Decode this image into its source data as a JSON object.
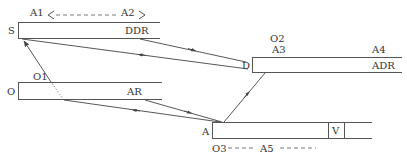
{
  "colors": {
    "line": "#444444",
    "text": "#333333",
    "background": "#ffffff"
  },
  "bars": {
    "s": {
      "left_label": "S",
      "inner_label": "DDR"
    },
    "o": {
      "left_label": "O",
      "inner_label": "AR",
      "top_label": "O1"
    },
    "d": {
      "left_label": "D",
      "inner_label": "ADR",
      "top_label": "O2",
      "top_left_label": "A3",
      "top_right_label": "A4"
    },
    "a": {
      "left_label": "A",
      "cell_label": "V"
    }
  },
  "annotations": {
    "range_top": {
      "start": "A1",
      "end": "A2"
    },
    "range_bottom": {
      "start": "O3",
      "mid": "A5"
    }
  },
  "connections": [
    {
      "from": "S",
      "to": "D",
      "arrow": "toward-D"
    },
    {
      "from": "D",
      "to": "S",
      "arrow": "toward-S"
    },
    {
      "from": "A",
      "to": "S",
      "arrow": "toward-S"
    },
    {
      "from": "O",
      "to": "A",
      "arrow": "toward-A"
    },
    {
      "from": "A",
      "to": "O",
      "arrow": "toward-O"
    },
    {
      "from": "A",
      "to": "D",
      "arrow": "toward-D"
    }
  ]
}
